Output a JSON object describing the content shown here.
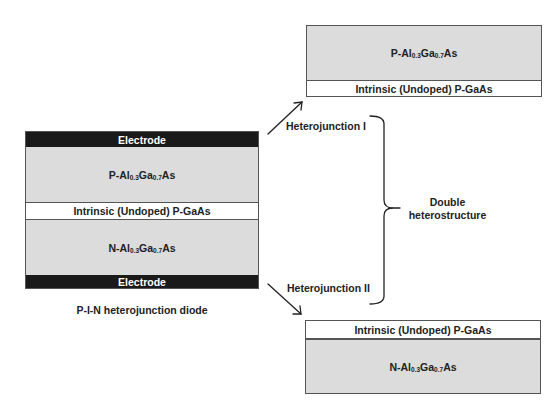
{
  "diagram": {
    "left_stack": {
      "caption": "P-I-N heterojunction diode",
      "layers": [
        {
          "type": "electrode",
          "label": "Electrode"
        },
        {
          "type": "alloy",
          "prefix": "P-Al",
          "sub1": "0.3",
          "mid": "Ga",
          "sub2": "0.7",
          "suffix": "As"
        },
        {
          "type": "intrinsic",
          "label": "Intrinsic (Undoped) P-GaAs"
        },
        {
          "type": "alloy",
          "prefix": "N-Al",
          "sub1": "0.3",
          "mid": "Ga",
          "sub2": "0.7",
          "suffix": "As"
        },
        {
          "type": "electrode",
          "label": "Electrode"
        }
      ]
    },
    "top_right_stack": {
      "layers": [
        {
          "type": "alloy",
          "prefix": "P-Al",
          "sub1": "0.3",
          "mid": "Ga",
          "sub2": "0.7",
          "suffix": "As"
        },
        {
          "type": "intrinsic",
          "label": "Intrinsic (Undoped) P-GaAs"
        }
      ]
    },
    "bottom_right_stack": {
      "layers": [
        {
          "type": "intrinsic",
          "label": "Intrinsic (Undoped) P-GaAs"
        },
        {
          "type": "alloy",
          "prefix": "N-Al",
          "sub1": "0.3",
          "mid": "Ga",
          "sub2": "0.7",
          "suffix": "As"
        }
      ]
    },
    "heterojunction_1": "Heterojunction I",
    "heterojunction_2": "Heterojunction II",
    "brace_label_line1": "Double",
    "brace_label_line2": "heterostructure",
    "colors": {
      "electrode": "#1a1a1a",
      "alloy_fill": "#dcdcdc",
      "intrinsic_fill": "#ffffff",
      "border": "#555555"
    }
  }
}
